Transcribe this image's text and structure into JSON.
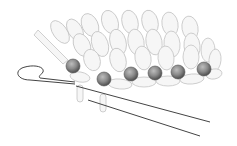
{
  "illustration": {
    "subject": "beaded knitting with crochet hook",
    "colors": {
      "background": "#ffffff",
      "stitch_outline": "#c8c8c8",
      "stitch_fill": "#f4f4f4",
      "hook_line": "#444444",
      "bead_dark": "#5a5a5a",
      "bead_mid": "#8a8a8a",
      "bead_light": "#bdbdbd"
    },
    "beads": [
      {
        "cx": 73,
        "cy": 66,
        "r": 7
      },
      {
        "cx": 104,
        "cy": 79,
        "r": 7
      },
      {
        "cx": 131,
        "cy": 74,
        "r": 7
      },
      {
        "cx": 155,
        "cy": 73,
        "r": 7
      },
      {
        "cx": 178,
        "cy": 72,
        "r": 7
      },
      {
        "cx": 204,
        "cy": 69,
        "r": 7
      }
    ]
  }
}
